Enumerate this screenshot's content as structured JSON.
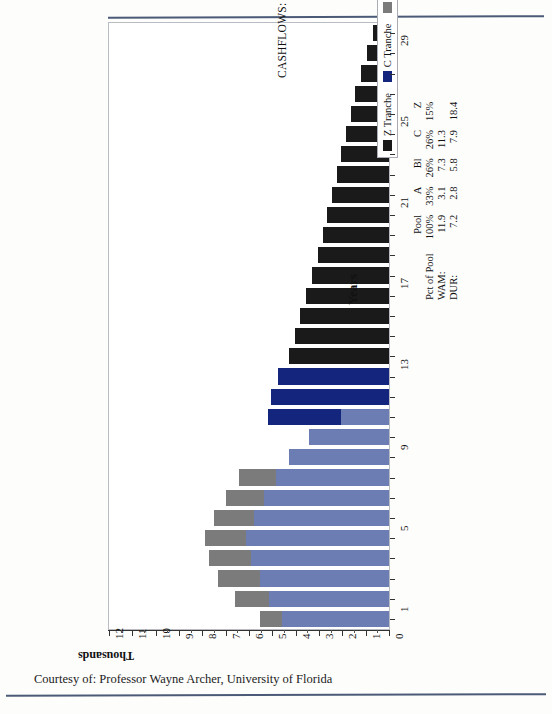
{
  "chart_data": {
    "type": "bar",
    "title": "CASHFLOWS: SEQUENTIAL PAY TRANCHES",
    "subtitle": "PSA: 100%",
    "orientation": "vertical",
    "xlabel": "Years",
    "ylabel": "Thousands",
    "ylim": [
      0,
      12
    ],
    "ytick_labels": [
      "0",
      "1",
      "2",
      "3",
      "4",
      "5",
      "6",
      "7",
      "8",
      "9",
      "10",
      "11",
      "12"
    ],
    "xtick_labels": [
      "1",
      "5",
      "9",
      "13",
      "17",
      "21",
      "25",
      "29"
    ],
    "grid": false,
    "legend_position": "inside-right",
    "stacked": true,
    "categories": [
      1,
      2,
      3,
      4,
      5,
      6,
      7,
      8,
      9,
      10,
      11,
      12,
      13,
      14,
      15,
      16,
      17,
      18,
      19,
      20,
      21,
      22,
      23,
      24,
      25,
      26,
      27,
      28,
      29,
      30
    ],
    "series": [
      {
        "name": "A Tranche",
        "color": "#6b7db3",
        "values": [
          4.6,
          5.15,
          5.55,
          5.9,
          6.15,
          5.8,
          5.35,
          4.85,
          4.3,
          3.45,
          2.05,
          0.0,
          0.0,
          0.0,
          0.0,
          0.0,
          0.0,
          0.0,
          0.0,
          0.0,
          0.0,
          0.0,
          0.0,
          0.0,
          0.0,
          0.0,
          0.0,
          0.0,
          0.0,
          0.0
        ]
      },
      {
        "name": "B Tranche",
        "color": "#14257e",
        "values": [
          0.0,
          0.0,
          0.0,
          0.0,
          0.0,
          0.0,
          0.0,
          0.0,
          0.0,
          0.0,
          3.15,
          5.05,
          4.75,
          4.45,
          4.15,
          3.85,
          3.6,
          3.35,
          3.1,
          2.85,
          0.0,
          0.0,
          0.0,
          0.0,
          0.0,
          0.0,
          0.0,
          0.0,
          0.0,
          0.0
        ]
      },
      {
        "name": "C Tranche",
        "color": "#7b7b7b",
        "values": [
          0.95,
          1.45,
          1.8,
          1.8,
          1.75,
          1.7,
          1.65,
          1.6,
          0.0,
          0.0,
          0.0,
          0.0,
          0.0,
          0.0,
          0.0,
          0.0,
          0.0,
          0.0,
          0.0,
          0.0,
          0.0,
          0.0,
          0.0,
          0.0,
          0.0,
          0.0,
          0.0,
          0.0,
          0.0,
          0.0
        ]
      },
      {
        "name": "Z Tranche",
        "color": "#1a1a1a",
        "values": [
          0.0,
          0.0,
          0.0,
          0.0,
          0.0,
          0.0,
          0.0,
          0.0,
          0.0,
          0.0,
          0.0,
          0.0,
          0.0,
          4.3,
          4.05,
          3.8,
          3.55,
          3.3,
          3.05,
          2.85,
          2.65,
          2.45,
          2.25,
          2.05,
          1.85,
          1.65,
          1.45,
          1.2,
          0.95,
          0.7
        ]
      }
    ],
    "stacked_rows": [
      {
        "year": 1,
        "A": 4.6,
        "C": 0.95,
        "B": 0.0,
        "Z": 0.0
      },
      {
        "year": 2,
        "A": 5.15,
        "C": 1.45,
        "B": 0.0,
        "Z": 0.0
      },
      {
        "year": 3,
        "A": 5.55,
        "C": 1.8,
        "B": 0.0,
        "Z": 0.0
      },
      {
        "year": 4,
        "A": 5.9,
        "C": 1.8,
        "B": 0.0,
        "Z": 0.0
      },
      {
        "year": 5,
        "A": 6.15,
        "C": 1.75,
        "B": 0.0,
        "Z": 0.0
      },
      {
        "year": 6,
        "A": 5.8,
        "C": 1.7,
        "B": 0.0,
        "Z": 0.0
      },
      {
        "year": 7,
        "A": 5.35,
        "C": 1.65,
        "B": 0.0,
        "Z": 0.0
      },
      {
        "year": 8,
        "A": 4.85,
        "C": 1.6,
        "B": 0.0,
        "Z": 0.0
      },
      {
        "year": 9,
        "A": 4.3,
        "C": 0.0,
        "B": 0.0,
        "Z": 0.0
      },
      {
        "year": 10,
        "A": 3.45,
        "C": 0.0,
        "B": 0.0,
        "Z": 0.0
      },
      {
        "year": 11,
        "A": 2.05,
        "C": 0.0,
        "B": 3.15,
        "Z": 0.0
      },
      {
        "year": 12,
        "A": 0.0,
        "C": 0.0,
        "B": 5.05,
        "Z": 0.0
      },
      {
        "year": 13,
        "A": 0.0,
        "C": 0.0,
        "B": 4.75,
        "Z": 0.0
      },
      {
        "year": 14,
        "A": 0.0,
        "C": 0.0,
        "B": 0.0,
        "Z": 4.3
      },
      {
        "year": 15,
        "A": 0.0,
        "C": 0.0,
        "B": 0.0,
        "Z": 4.05
      },
      {
        "year": 16,
        "A": 0.0,
        "C": 0.0,
        "B": 0.0,
        "Z": 3.8
      },
      {
        "year": 17,
        "A": 0.0,
        "C": 0.0,
        "B": 0.0,
        "Z": 3.55
      },
      {
        "year": 18,
        "A": 0.0,
        "C": 0.0,
        "B": 0.0,
        "Z": 3.3
      },
      {
        "year": 19,
        "A": 0.0,
        "C": 0.0,
        "B": 0.0,
        "Z": 3.05
      },
      {
        "year": 20,
        "A": 0.0,
        "C": 0.0,
        "B": 0.0,
        "Z": 2.85
      },
      {
        "year": 21,
        "A": 0.0,
        "C": 0.0,
        "B": 0.0,
        "Z": 2.65
      },
      {
        "year": 22,
        "A": 0.0,
        "C": 0.0,
        "B": 0.0,
        "Z": 2.45
      },
      {
        "year": 23,
        "A": 0.0,
        "C": 0.0,
        "B": 0.0,
        "Z": 2.25
      },
      {
        "year": 24,
        "A": 0.0,
        "C": 0.0,
        "B": 0.0,
        "Z": 2.05
      },
      {
        "year": 25,
        "A": 0.0,
        "C": 0.0,
        "B": 0.0,
        "Z": 1.85
      },
      {
        "year": 26,
        "A": 0.0,
        "C": 0.0,
        "B": 0.0,
        "Z": 1.65
      },
      {
        "year": 27,
        "A": 0.0,
        "C": 0.0,
        "B": 0.0,
        "Z": 1.45
      },
      {
        "year": 28,
        "A": 0.0,
        "C": 0.0,
        "B": 0.0,
        "Z": 1.2
      },
      {
        "year": 29,
        "A": 0.0,
        "C": 0.0,
        "B": 0.0,
        "Z": 0.95
      },
      {
        "year": 30,
        "A": 0.0,
        "C": 0.0,
        "B": 0.0,
        "Z": 0.7
      }
    ]
  },
  "legend": {
    "items": [
      {
        "label": "Z Tranche",
        "color": "#1a1a1a"
      },
      {
        "label": "C Tranche",
        "color": "#14257e"
      },
      {
        "label": "B Tranche",
        "color": "#7b7b7b"
      },
      {
        "label": "A Tranche",
        "color": "#4f63a8"
      }
    ]
  },
  "stats_table": {
    "col_headers": [
      "",
      "Pool",
      "A",
      "Bl",
      "C",
      "Z"
    ],
    "rows": [
      {
        "label": "Pct of Pool",
        "values": [
          "100%",
          "33%",
          "26%",
          "26%",
          "15%"
        ]
      },
      {
        "label": "WAM:",
        "values": [
          "11.9",
          "3.1",
          "7.3",
          "11.3",
          ""
        ]
      },
      {
        "label": "DUR:",
        "values": [
          "7.2",
          "2.8",
          "5.8",
          "7.9",
          "18.4"
        ]
      }
    ],
    "header_row": [
      "Pool",
      "A",
      "Bl",
      "C",
      "Z"
    ],
    "pct_row": [
      "100%",
      "33%",
      "26%",
      "26%",
      "15%"
    ],
    "wam_row": [
      "11.9",
      "3.1",
      "7.3",
      "11.3",
      ""
    ],
    "dur_row": [
      "7.2",
      "2.8",
      "5.8",
      "7.9",
      "18.4"
    ],
    "pct_label": "Pct of Pool",
    "wam_label": "WAM:",
    "dur_label": "DUR:"
  },
  "footer": {
    "credit": "Courtesy of: Professor Wayne Archer, University of Florida"
  },
  "colors": {
    "a_tranche": "#6b7db3",
    "b_tranche": "#14257e",
    "c_tranche": "#7b7b7b",
    "z_tranche": "#1a1a1a",
    "rule": "#4b5a77",
    "frame": "#b9bcc2"
  }
}
